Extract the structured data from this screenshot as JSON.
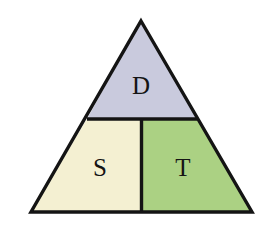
{
  "diagram": {
    "shape": "triangle",
    "background_color": "#ffffff",
    "stroke_color": "#141414",
    "stroke_width": 3.4,
    "vertices": {
      "apex": [
        141,
        21
      ],
      "bottom_left": [
        31,
        212
      ],
      "bottom_right": [
        252,
        212
      ]
    },
    "dividers": {
      "horizontal_y": 119,
      "horizontal_left_x": 87,
      "horizontal_right_x": 197,
      "vertical_x": 141.5,
      "vertical_top_y": 119,
      "vertical_bottom_y": 212
    },
    "regions": [
      {
        "id": "top",
        "label": "D",
        "fill_color": "#c9cadd",
        "label_x": 141,
        "label_y": 88,
        "description": "upper apex triangle"
      },
      {
        "id": "bottom-left",
        "label": "S",
        "fill_color": "#f4f0d2",
        "label_x": 100,
        "label_y": 170,
        "description": "lower left trapezoid"
      },
      {
        "id": "bottom-right",
        "label": "T",
        "fill_color": "#abd183",
        "label_x": 183,
        "label_y": 170,
        "description": "lower right trapezoid"
      }
    ]
  }
}
